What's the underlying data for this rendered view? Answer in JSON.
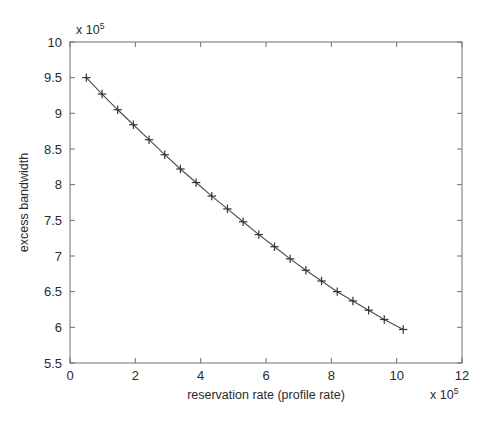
{
  "chart_data": {
    "type": "line",
    "title": "",
    "xlabel": "reservation rate (profile rate)",
    "ylabel": "excess bandwidth",
    "x_multiplier": "x 10",
    "x_exponent": "5",
    "y_multiplier": "x 10",
    "y_exponent": "5",
    "xlim": [
      0,
      12
    ],
    "ylim": [
      5.5,
      10
    ],
    "xticks": [
      0,
      2,
      4,
      6,
      8,
      10,
      12
    ],
    "xticklabels": [
      "0",
      "2",
      "4",
      "6",
      "8",
      "10",
      "12"
    ],
    "yticks": [
      5.5,
      6,
      6.5,
      7,
      7.5,
      8,
      8.5,
      9,
      9.5,
      10
    ],
    "yticklabels": [
      "5.5",
      "6",
      "6.5",
      "7",
      "7.5",
      "8",
      "8.5",
      "9",
      "9.5",
      "10"
    ],
    "grid": false,
    "legend": null,
    "marker": "plus",
    "line_color": "#4a4a4a",
    "series": [
      {
        "name": "excess bandwidth",
        "x": [
          0.5,
          0.98,
          1.46,
          1.94,
          2.42,
          2.9,
          3.38,
          3.86,
          4.34,
          4.82,
          5.3,
          5.78,
          6.26,
          6.74,
          7.22,
          7.7,
          8.18,
          8.66,
          9.14,
          9.62,
          10.2
        ],
        "y": [
          9.5,
          9.27,
          9.05,
          8.84,
          8.63,
          8.42,
          8.22,
          8.03,
          7.84,
          7.66,
          7.48,
          7.3,
          7.13,
          6.96,
          6.8,
          6.65,
          6.5,
          6.37,
          6.24,
          6.11,
          5.97
        ]
      }
    ]
  }
}
